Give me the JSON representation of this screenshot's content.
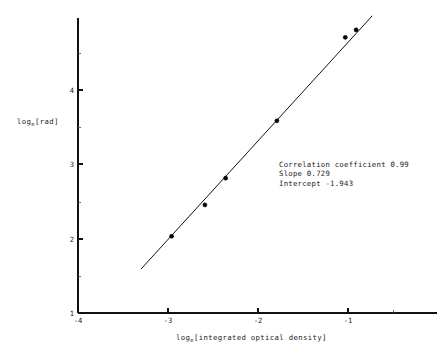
{
  "chart_data": {
    "type": "scatter",
    "title": "",
    "xlabel": "log_e[integrated optical density]",
    "ylabel": "log_e[rad]",
    "xlabel_prefix": "log",
    "xlabel_sub": "e",
    "xlabel_rest": "[integrated optical density]",
    "ylabel_prefix": "log",
    "ylabel_sub": "e",
    "ylabel_rest": "[rad]",
    "xlim": [
      -4.0,
      -0.05
    ],
    "ylim": [
      1.0,
      5.2
    ],
    "xticks": [
      -4,
      -3,
      -2,
      -1
    ],
    "xticklabels": [
      "-4",
      "-3",
      "-2",
      "-1"
    ],
    "yticks": [
      1,
      2,
      3,
      4
    ],
    "yticklabels": [
      "1",
      "2",
      "3",
      "4"
    ],
    "x_minor_ticks": [
      -0.5
    ],
    "y_minor_ticks": [
      1.5,
      2.5,
      3.5,
      4.5
    ],
    "grid": false,
    "legend": "none",
    "x": [
      -2.96,
      -2.59,
      -2.36,
      -1.79,
      -1.03,
      -0.91
    ],
    "y": [
      2.03,
      2.45,
      2.81,
      3.58,
      4.7,
      4.8
    ],
    "points": [
      {
        "x": -2.96,
        "y": 2.03
      },
      {
        "x": -2.59,
        "y": 2.45
      },
      {
        "x": -2.36,
        "y": 2.81
      },
      {
        "x": -1.79,
        "y": 3.58
      },
      {
        "x": -1.03,
        "y": 4.7
      },
      {
        "x": -0.91,
        "y": 4.8
      }
    ],
    "fit_line": {
      "slope": 0.729,
      "intercept": -1.943,
      "x_start": -3.3,
      "y_start": 1.59,
      "x_end": -0.73,
      "y_end": 4.99
    },
    "annotations": {
      "correlation_line": "Correlation coefficient 0.99",
      "slope_line": "Slope 0.729",
      "intercept_line": "Intercept -1.943"
    }
  },
  "colors": {
    "axis": "#111111",
    "marker": "#000000",
    "line": "#111111",
    "text": "#1a1a1a",
    "background": "#ffffff"
  }
}
